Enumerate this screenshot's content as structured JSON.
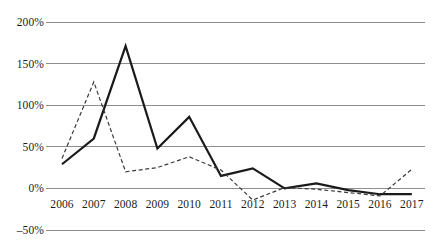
{
  "chart_data": {
    "type": "line",
    "title": "",
    "subtitle": "",
    "xlabel": "",
    "ylabel": "",
    "categories": [
      "2006",
      "2007",
      "2008",
      "2009",
      "2010",
      "2011",
      "2012",
      "2013",
      "2014",
      "2015",
      "2016",
      "2017"
    ],
    "ytick_labels": [
      "200%",
      "150%",
      "100%",
      "50%",
      "0%",
      "–50%"
    ],
    "ytick_values": [
      200,
      150,
      100,
      50,
      0,
      -50
    ],
    "ylim": [
      -50,
      200
    ],
    "grid": "horizontal",
    "legend": "none",
    "unit": "percent",
    "series": [
      {
        "name": "series-solid",
        "style": "solid",
        "color": "#1a1a1a",
        "width": 2.2,
        "values": [
          29,
          60,
          171,
          48,
          86,
          15,
          24,
          0,
          6,
          -2,
          -7,
          -7
        ]
      },
      {
        "name": "series-dashed",
        "style": "dashed",
        "color": "#3a3a3a",
        "width": 1.2,
        "values": [
          36,
          128,
          20,
          25,
          38,
          22,
          -14,
          1,
          -1,
          -5,
          -9,
          23
        ]
      }
    ],
    "gridline_color": "#8e8e8e",
    "background": "#ffffff"
  },
  "geometry": {
    "plot_left": 46,
    "plot_right": 425,
    "first_category_x": 62,
    "category_spacing": 31.8,
    "y_at_200": 22,
    "y_at_minus50": 230
  }
}
